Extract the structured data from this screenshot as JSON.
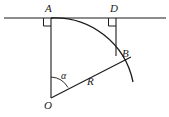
{
  "figure": {
    "kind": "geometry-diagram",
    "background_color": "#ffffff",
    "stroke_color": "#1a1a1a",
    "labels": {
      "A": "A",
      "D": "D",
      "B": "B",
      "R": "R",
      "O": "O",
      "alpha": "α"
    },
    "geometry": {
      "horizontal_line": {
        "x1": 4,
        "y1": 18,
        "x2": 166,
        "y2": 18
      },
      "vertical_AO": {
        "x1": 51,
        "y1": 18,
        "x2": 51,
        "y2": 98
      },
      "vertical_DB": {
        "x1": 116,
        "y1": 18,
        "x2": 116,
        "y2": 56
      },
      "radius_OB": {
        "x1": 51,
        "y1": 98,
        "x2": 131,
        "y2": 57
      },
      "arc": {
        "center_x": 51,
        "center_y": 98,
        "radius": 80,
        "start_x": 51,
        "start_y": 18,
        "end_x": 133,
        "end_y": 82
      },
      "angle_arc": {
        "center_x": 51,
        "center_y": 98,
        "radius": 21
      },
      "right_angle_A": {
        "x": 47,
        "y": 18,
        "size": 8
      },
      "right_angle_D": {
        "x": 112,
        "y": 18,
        "size": 8
      }
    }
  }
}
